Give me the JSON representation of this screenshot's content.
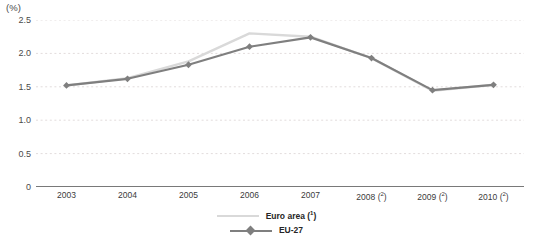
{
  "chart_data": {
    "type": "line",
    "title": "",
    "subtitle": "",
    "xlabel": "",
    "ylabel": "(%)",
    "unit_label": "(%)",
    "categories": [
      "2003",
      "2004",
      "2005",
      "2006",
      "2007",
      "2008",
      "2009",
      "2010"
    ],
    "category_labels": [
      {
        "year": "2003",
        "footnote": ""
      },
      {
        "year": "2004",
        "footnote": ""
      },
      {
        "year": "2005",
        "footnote": ""
      },
      {
        "year": "2006",
        "footnote": ""
      },
      {
        "year": "2007",
        "footnote": ""
      },
      {
        "year": "2008",
        "footnote": "2"
      },
      {
        "year": "2009",
        "footnote": "2"
      },
      {
        "year": "2010",
        "footnote": "2"
      }
    ],
    "series": [
      {
        "name": "Euro area",
        "footnote": "1",
        "color": "#d9d9d9",
        "marker": "none",
        "values": [
          1.52,
          1.63,
          1.88,
          2.3,
          2.25,
          1.93,
          1.44,
          1.53
        ]
      },
      {
        "name": "EU-27",
        "footnote": "",
        "color": "#7f7f7f",
        "marker": "diamond",
        "values": [
          1.52,
          1.62,
          1.83,
          2.1,
          2.24,
          1.93,
          1.45,
          1.53
        ]
      }
    ],
    "ylim": [
      0,
      2.5
    ],
    "yticks": [
      0,
      0.5,
      1.0,
      1.5,
      2.0,
      2.5
    ],
    "ytick_labels": [
      "0",
      "0.5",
      "1.0",
      "1.5",
      "2.0",
      "2.5"
    ],
    "grid": true,
    "grid_style": "dotted",
    "grid_color": "#e2dcdc",
    "legend_position": "bottom-center",
    "axis_color": "#4d4d4d"
  },
  "legend": {
    "items": [
      {
        "label": "Euro area",
        "footnote": "1"
      },
      {
        "label": "EU-27",
        "footnote": ""
      }
    ]
  }
}
